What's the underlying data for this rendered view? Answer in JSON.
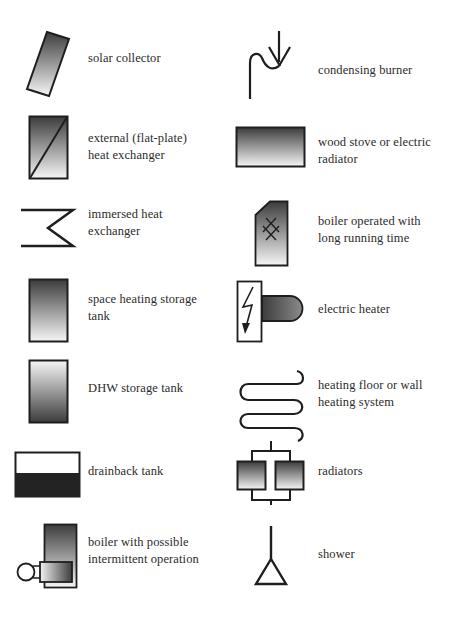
{
  "colors": {
    "stroke": "#1e1e1e",
    "gradient_dark": "#3a3a3a",
    "gradient_light": "#f4f4f4",
    "drainback_fill": "#222222",
    "background": "#ffffff"
  },
  "legend": {
    "left": [
      {
        "id": "solar-collector",
        "icon": "solar-collector-icon",
        "lines": [
          "solar collector"
        ]
      },
      {
        "id": "external-heat-exchanger",
        "icon": "flat-plate-heat-exchanger-icon",
        "lines": [
          "external (flat-plate)",
          "heat exchanger"
        ]
      },
      {
        "id": "immersed-heat-exchanger",
        "icon": "immersed-heat-exchanger-icon",
        "lines": [
          "immersed heat",
          "exchanger"
        ]
      },
      {
        "id": "space-heating-storage-tank",
        "icon": "space-heating-tank-icon",
        "lines": [
          "space heating storage",
          "tank"
        ]
      },
      {
        "id": "dhw-storage-tank",
        "icon": "dhw-tank-icon",
        "lines": [
          "DHW storage tank"
        ]
      },
      {
        "id": "drainback-tank",
        "icon": "drainback-tank-icon",
        "lines": [
          "drainback tank"
        ]
      },
      {
        "id": "boiler-intermittent",
        "icon": "boiler-intermittent-icon",
        "lines": [
          "boiler with possible",
          "intermittent operation"
        ]
      }
    ],
    "right": [
      {
        "id": "condensing-burner",
        "icon": "condensing-burner-icon",
        "lines": [
          "condensing burner"
        ]
      },
      {
        "id": "wood-stove",
        "icon": "wood-stove-icon",
        "lines": [
          "wood stove or electric",
          "radiator"
        ]
      },
      {
        "id": "boiler-long-running",
        "icon": "boiler-long-running-icon",
        "lines": [
          "boiler operated with",
          "long running time"
        ]
      },
      {
        "id": "electric-heater",
        "icon": "electric-heater-icon",
        "lines": [
          "electric heater"
        ]
      },
      {
        "id": "floor-wall-heating",
        "icon": "floor-heating-coil-icon",
        "lines": [
          "heating floor or wall",
          "heating system"
        ]
      },
      {
        "id": "radiators",
        "icon": "radiators-icon",
        "lines": [
          "radiators"
        ]
      },
      {
        "id": "shower",
        "icon": "shower-icon",
        "lines": [
          "shower"
        ]
      }
    ]
  }
}
